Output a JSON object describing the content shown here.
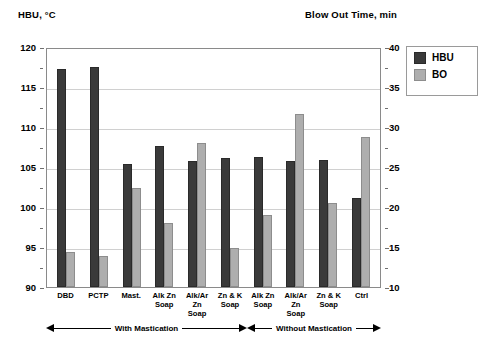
{
  "chart_data": {
    "type": "bar",
    "title": "",
    "categories": [
      "DBD",
      "PCTP",
      "Mast.",
      "Alk Zn Soap",
      "Alk/Ar Zn Soap",
      "Zn & K Soap",
      "Alk Zn Soap",
      "Alk/Ar Zn Soap",
      "Zn & K Soap",
      "Ctrl"
    ],
    "series": [
      {
        "name": "HBU",
        "axis": "left",
        "values": [
          117.3,
          117.5,
          105.4,
          107.6,
          105.8,
          106.1,
          106.3,
          105.8,
          105.9,
          101.1
        ]
      },
      {
        "name": "BO",
        "axis": "right",
        "values": [
          14.4,
          13.9,
          22.4,
          18.0,
          28.0,
          14.9,
          19.0,
          31.6,
          20.5,
          28.7
        ]
      }
    ],
    "left_axis": {
      "label": "HBU, °C",
      "min": 90,
      "max": 120,
      "step": 5,
      "ticks": [
        120,
        115,
        110,
        105,
        100,
        95,
        90
      ]
    },
    "right_axis": {
      "label": "Blow Out Time, min",
      "min": 10,
      "max": 40,
      "step": 5,
      "ticks": [
        40,
        35,
        30,
        25,
        20,
        15,
        10
      ]
    },
    "grid": true,
    "legend_position": "right",
    "annotations": [
      {
        "text": "With Mastication",
        "from": "DBD",
        "to": "Zn & K Soap"
      },
      {
        "text": "Without Mastication",
        "from": "Alk Zn Soap",
        "to": "Ctrl"
      }
    ],
    "colors": {
      "HBU": "#3a3a3a",
      "BO": "#aeaeae"
    }
  },
  "legend": {
    "items": [
      {
        "label": "HBU",
        "color": "#3a3a3a"
      },
      {
        "label": "BO",
        "color": "#aeaeae"
      }
    ]
  },
  "caption": ""
}
